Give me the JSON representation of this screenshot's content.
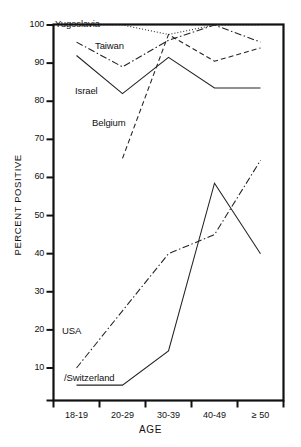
{
  "chart_data": {
    "type": "line",
    "title": "",
    "xlabel": "AGE",
    "ylabel": "PERCENT POSITIVE",
    "categories": [
      "18-19",
      "20-29",
      "30-39",
      "40-49",
      "≥ 50"
    ],
    "ylim": [
      5,
      102
    ],
    "yticks": [
      10,
      20,
      30,
      40,
      50,
      60,
      70,
      80,
      90,
      100
    ],
    "ytick_labels": [
      "10",
      "20",
      "30",
      "40",
      "50",
      "60",
      "70",
      "80",
      "90",
      "100"
    ],
    "grid": false,
    "legend": "inline-labels",
    "series": [
      {
        "name": "Yugoslavia",
        "style": "dotted",
        "color": "#222222",
        "x": [
          "18-19",
          "20-29",
          "30-39",
          "40-49",
          "≥ 50"
        ],
        "values": [
          100,
          100,
          97.5,
          100,
          100
        ]
      },
      {
        "name": "Taiwan",
        "style": "dash-dot",
        "color": "#222222",
        "x": [
          "18-19",
          "20-29",
          "30-39",
          "40-49",
          "≥ 50"
        ],
        "values": [
          95.5,
          89,
          96,
          100,
          95.5
        ]
      },
      {
        "name": "Israel",
        "style": "solid",
        "color": "#222222",
        "x": [
          "18-19",
          "20-29",
          "30-39",
          "40-49",
          "≥ 50"
        ],
        "values": [
          92,
          82,
          91.5,
          83.5,
          83.5
        ]
      },
      {
        "name": "Belgium",
        "style": "dashed",
        "color": "#222222",
        "x": [
          "20-29",
          "30-39",
          "40-49",
          "≥ 50"
        ],
        "values": [
          65,
          97.5,
          90.5,
          94
        ]
      },
      {
        "name": "USA",
        "style": "dash-dot",
        "color": "#222222",
        "x": [
          "18-19",
          "20-29",
          "30-39",
          "40-49",
          "≥ 50"
        ],
        "values": [
          10,
          25,
          40,
          45,
          64.5
        ]
      },
      {
        "name": "Switzerland",
        "style": "solid",
        "color": "#222222",
        "x": [
          "18-19",
          "20-29",
          "30-39",
          "40-49",
          "≥ 50"
        ],
        "values": [
          5.5,
          5.5,
          14.5,
          58.5,
          40
        ]
      }
    ],
    "annotations": [
      {
        "text": "Yugoslavia",
        "series": "Yugoslavia"
      },
      {
        "text": "Taiwan",
        "series": "Taiwan"
      },
      {
        "text": "Israel",
        "series": "Israel"
      },
      {
        "text": "Belgium",
        "series": "Belgium"
      },
      {
        "text": "USA",
        "series": "USA"
      },
      {
        "text": "/Switzerland",
        "series": "Switzerland"
      }
    ]
  }
}
